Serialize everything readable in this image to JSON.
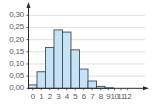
{
  "chart_data": {
    "type": "bar",
    "title": "",
    "xlabel": "",
    "ylabel": "",
    "categories": [
      "0",
      "1",
      "2",
      "3",
      "4",
      "5",
      "6",
      "7",
      "8",
      "9",
      "10",
      "11",
      "12"
    ],
    "values": [
      0.014,
      0.068,
      0.168,
      0.24,
      0.231,
      0.158,
      0.079,
      0.03,
      0.008,
      0.002,
      0.0,
      0.0,
      0.0
    ],
    "ylim": [
      0,
      0.3
    ],
    "yticks": [
      "0,00",
      "0,05",
      "0,10",
      "0,15",
      "0,20",
      "0,25",
      "0,30"
    ],
    "ytick_values": [
      0.0,
      0.05,
      0.1,
      0.15,
      0.2,
      0.25,
      0.3
    ],
    "grid": true,
    "legend": null,
    "colors": {
      "bar_fill": "#c6e3f5",
      "bar_stroke": "#3e4c5a",
      "grid": "#d9d9d9",
      "axis": "#2b2b2b",
      "text": "#5a5a5a"
    }
  }
}
